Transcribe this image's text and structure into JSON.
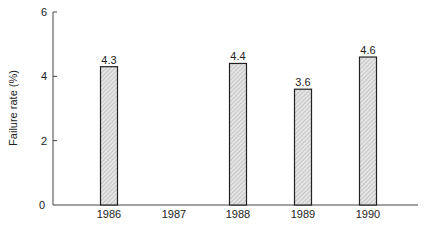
{
  "chart_data": {
    "type": "bar",
    "title": "",
    "xlabel": "",
    "ylabel": "Failure rate (%)",
    "categories": [
      "1986",
      "1987",
      "1988",
      "1989",
      "1990"
    ],
    "values": [
      4.3,
      null,
      4.4,
      3.6,
      4.6
    ],
    "value_labels": [
      "4.3",
      "",
      "4.4",
      "3.6",
      "4.6"
    ],
    "ylim": [
      0,
      6
    ],
    "yticks": [
      0,
      2,
      4,
      6
    ],
    "ytick_labels": [
      "0",
      "2",
      "4",
      "6"
    ],
    "grid": false,
    "legend": null,
    "bar_fill": "hatched light gray",
    "colors": {
      "bar_fill": "#d8d8d8",
      "bar_stroke": "#222222",
      "axis": "#444444"
    }
  }
}
